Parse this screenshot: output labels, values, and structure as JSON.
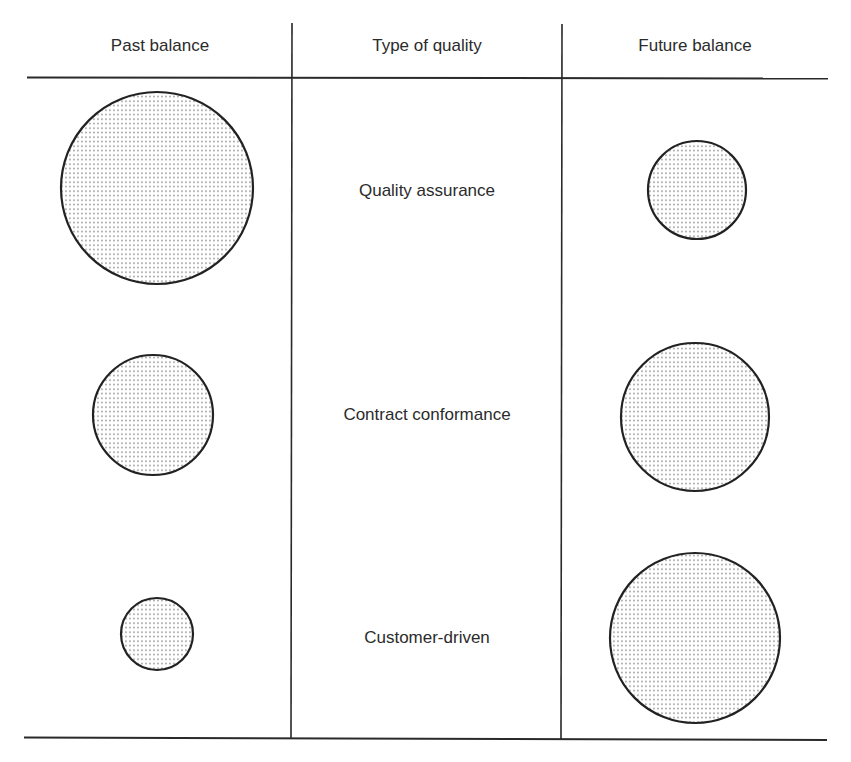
{
  "colors": {
    "line": "#2a2a2a",
    "circle_stroke": "#222222",
    "dot": "#8a8a8a",
    "background": "#ffffff"
  },
  "headers": {
    "past": "Past balance",
    "type": "Type of quality",
    "future": "Future balance"
  },
  "rows": [
    {
      "label": "Quality assurance",
      "past_radius": 96,
      "future_radius": 49
    },
    {
      "label": "Contract conformance",
      "past_radius": 60,
      "future_radius": 74
    },
    {
      "label": "Customer-driven",
      "past_radius": 36,
      "future_radius": 85
    }
  ]
}
